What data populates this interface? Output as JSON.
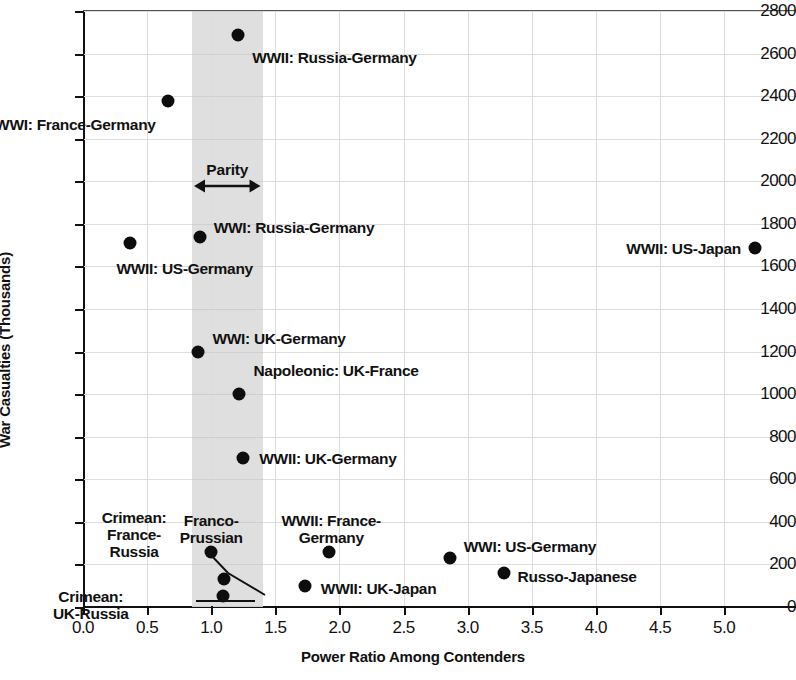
{
  "chart_data": {
    "type": "scatter",
    "title": "",
    "xlabel": "Power Ratio Among Contenders",
    "ylabel": "War Casualties (Thousands)",
    "xlim": [
      0.0,
      5.56
    ],
    "ylim": [
      0,
      2800
    ],
    "xticks": [
      "0.0",
      "0.5",
      "1.0",
      "1.5",
      "2.0",
      "2.5",
      "3.0",
      "3.5",
      "4.0",
      "4.5",
      "5.0"
    ],
    "xtick_values": [
      0.0,
      0.5,
      1.0,
      1.5,
      2.0,
      2.5,
      3.0,
      3.5,
      4.0,
      4.5,
      5.0
    ],
    "yticks": [
      "0",
      "200",
      "400",
      "600",
      "800",
      "1000",
      "1200",
      "1400",
      "1600",
      "1800",
      "2000",
      "2200",
      "2400",
      "2600",
      "2800"
    ],
    "ytick_values": [
      0,
      200,
      400,
      600,
      800,
      1000,
      1200,
      1400,
      1600,
      1800,
      2000,
      2200,
      2400,
      2600,
      2800
    ],
    "grid": true,
    "legend": "none",
    "marker_color": "#0d0d0d",
    "band": {
      "label": "Parity",
      "x_start": 0.85,
      "x_end": 1.4,
      "color": "#dcdcdc",
      "arrow": "double-headed"
    },
    "points": [
      {
        "label": "WWII: Russia-Germany",
        "x": 1.21,
        "y": 2685,
        "label_pos": "below-right"
      },
      {
        "label": "WWI: France-Germany",
        "x": 0.66,
        "y": 2375,
        "label_pos": "below-left"
      },
      {
        "label": "WWII: US-Germany",
        "x": 0.37,
        "y": 1710,
        "label_pos": "below-right"
      },
      {
        "label": "WWI: Russia-Germany",
        "x": 0.91,
        "y": 1740,
        "label_pos": "above-right"
      },
      {
        "label": "WWII: US-Japan",
        "x": 5.24,
        "y": 1685,
        "label_pos": "left"
      },
      {
        "label": "WWI: UK-Germany",
        "x": 0.9,
        "y": 1200,
        "label_pos": "above-right"
      },
      {
        "label": "Napoleonic: UK-France",
        "x": 1.22,
        "y": 1000,
        "label_pos": "above-right"
      },
      {
        "label": "WWII: UK-Germany",
        "x": 1.25,
        "y": 700,
        "label_pos": "right"
      },
      {
        "label": "Franco-Prussian",
        "x": 1.0,
        "y": 260,
        "label_pos": "above-center"
      },
      {
        "label": "WWII: France-Germany",
        "x": 1.92,
        "y": 260,
        "label_pos": "above-center"
      },
      {
        "label": "WWI: US-Germany",
        "x": 2.86,
        "y": 230,
        "label_pos": "right"
      },
      {
        "label": "Russo-Japanese",
        "x": 3.28,
        "y": 160,
        "label_pos": "right"
      },
      {
        "label": "Crimean: France-Russia",
        "x": 1.1,
        "y": 130,
        "label_pos": "leader-left"
      },
      {
        "label": "WWII: UK-Japan",
        "x": 1.73,
        "y": 100,
        "label_pos": "right"
      },
      {
        "label": "Crimean: UK-Russia",
        "x": 1.09,
        "y": 50,
        "label_pos": "leader-left"
      }
    ],
    "annotations": [
      {
        "text": "Crimean:\nFrance-\nRussia",
        "type": "leader-label",
        "target": "Crimean: France-Russia"
      },
      {
        "text": "Crimean:\nUK-Russia",
        "type": "leader-label",
        "target": "Crimean: UK-Russia"
      },
      {
        "text": "Franco-\nPrussian",
        "type": "stacked-label",
        "target": "Franco-Prussian"
      },
      {
        "text": "WWII: France-\nGermany",
        "type": "stacked-label",
        "target": "WWII: France-Germany"
      },
      {
        "text": "Parity",
        "type": "band-label"
      }
    ]
  }
}
